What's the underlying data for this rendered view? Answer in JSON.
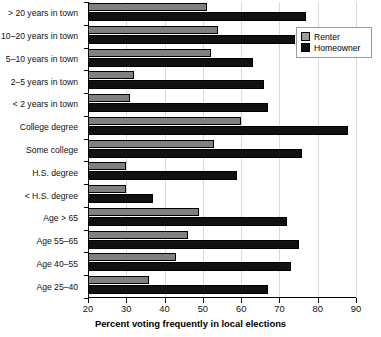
{
  "chart_data": {
    "type": "bar",
    "orientation": "horizontal",
    "title": "",
    "xlabel": "Percent voting frequently in local elections",
    "ylabel": "",
    "xlim": [
      20,
      90
    ],
    "xticks": [
      20,
      30,
      40,
      50,
      60,
      70,
      80,
      90
    ],
    "grid": true,
    "legend_position": "top-right",
    "categories": [
      "> 20 years in town",
      "10–20 years in town",
      "5–10 years in town",
      "2–5 years in town",
      "< 2 years in town",
      "College degree",
      "Some college",
      "H.S. degree",
      "< H.S. degree",
      "Age > 65",
      "Age 55–65",
      "Age 40–55",
      "Age 25–40"
    ],
    "series": [
      {
        "name": "Renter",
        "color": "#808080",
        "values": [
          51,
          54,
          52,
          32,
          31,
          60,
          53,
          30,
          30,
          49,
          46,
          43,
          36
        ]
      },
      {
        "name": "Homeowner",
        "color": "#111111",
        "values": [
          77,
          74,
          63,
          66,
          67,
          88,
          76,
          59,
          37,
          72,
          75,
          73,
          67
        ]
      }
    ]
  },
  "legend": {
    "items": [
      {
        "label": "Renter",
        "color": "#808080"
      },
      {
        "label": "Homeowner",
        "color": "#111111"
      }
    ]
  }
}
